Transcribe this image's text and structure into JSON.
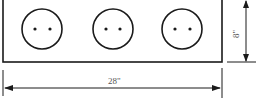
{
  "diagram": {
    "shape": "rectangle-panel",
    "width_label": "28\"",
    "height_label": "8\"",
    "outlets": [
      {
        "id": 1,
        "holes": 2
      },
      {
        "id": 2,
        "holes": 2
      },
      {
        "id": 3,
        "holes": 2
      }
    ],
    "colors": {
      "stroke": "#1a1a1a",
      "background": "#ffffff",
      "label": "#555555"
    }
  }
}
